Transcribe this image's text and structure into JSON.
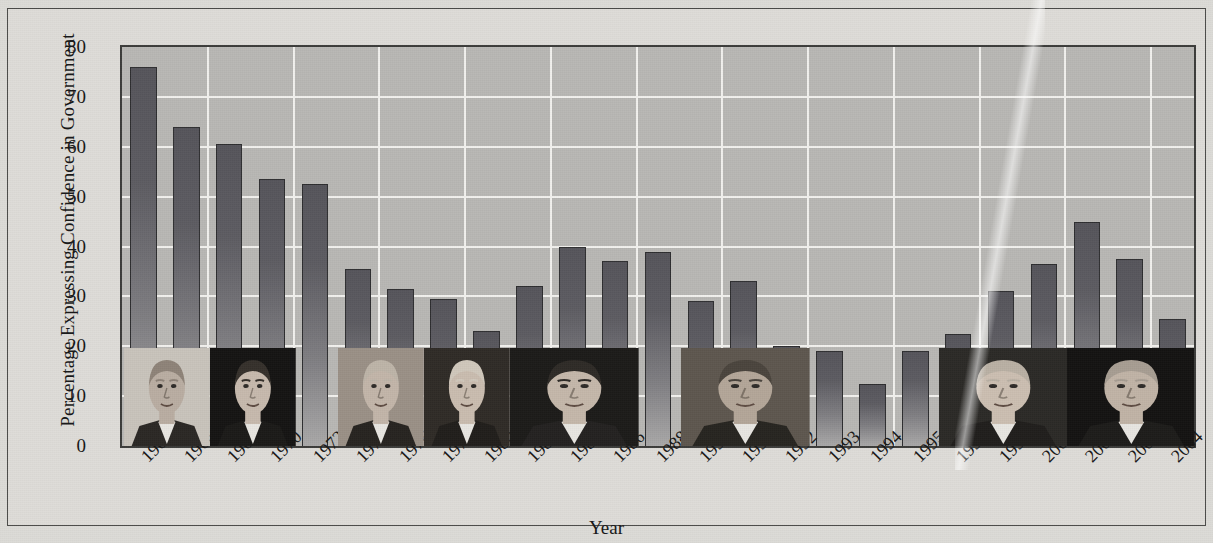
{
  "chart_data": {
    "type": "bar",
    "title": "",
    "xlabel": "Year",
    "ylabel": "Percentage Expressing Confidence in Government",
    "ylim": [
      0,
      80
    ],
    "yticks": [
      0,
      10,
      20,
      30,
      40,
      50,
      60,
      70,
      80
    ],
    "grid": true,
    "legend": "none",
    "categories": [
      "1964",
      "1966",
      "1968",
      "1970",
      "1972",
      "1974",
      "1976",
      "1978",
      "1980",
      "1982",
      "1984",
      "1986",
      "1988",
      "1990",
      "1991",
      "1992",
      "1993",
      "1994",
      "1995",
      "1996",
      "1998",
      "2000",
      "2001",
      "2002",
      "2004"
    ],
    "values": [
      76,
      64,
      60.5,
      53.5,
      52.5,
      35.5,
      31.5,
      29.5,
      23,
      32,
      40,
      37,
      39,
      29,
      33,
      20,
      19,
      12.5,
      19,
      22.5,
      31,
      36.5,
      45,
      37.5,
      25.5
    ],
    "bar_color": "#5a595f",
    "plot_background": "#b8b7b4",
    "gridline_color": "#f2f1ee"
  },
  "axes": {
    "y_title": "Percentage Expressing Confidence in Government",
    "x_title": "Year",
    "y_tick_labels": [
      "0",
      "10",
      "20",
      "30",
      "40",
      "50",
      "60",
      "70",
      "80"
    ],
    "x_tick_labels": [
      "1964",
      "1966",
      "1968",
      "1970",
      "1972",
      "1974",
      "1976",
      "1978",
      "1980",
      "1982",
      "1984",
      "1986",
      "1988",
      "1990",
      "1991",
      "1992",
      "1993",
      "1994",
      "1995",
      "1996",
      "1998",
      "2000",
      "2001",
      "2002",
      "2004"
    ]
  },
  "portraits": [
    {
      "name": "lyndon-b-johnson",
      "start_category": "1964",
      "span": 2,
      "skin": "#b9ada2",
      "hair": "#8e8378",
      "bg": "#c8c3bb",
      "suit": "#2a2724"
    },
    {
      "name": "richard-nixon",
      "start_category": "1968",
      "span": 2,
      "skin": "#c6b9ad",
      "hair": "#35302b",
      "bg": "#141312",
      "suit": "#1a1917"
    },
    {
      "name": "gerald-ford",
      "start_category": "1974",
      "span": 2,
      "skin": "#c2b5a9",
      "hair": "#bdb4a8",
      "bg": "#9a9086",
      "suit": "#26231f"
    },
    {
      "name": "jimmy-carter",
      "start_category": "1978",
      "span": 2,
      "skin": "#c9bcaf",
      "hair": "#cfc7bb",
      "bg": "#2f2b26",
      "suit": "#201d1a"
    },
    {
      "name": "ronald-reagan",
      "start_category": "1982",
      "span": 3,
      "skin": "#c4b7aa",
      "hair": "#2e2a26",
      "bg": "#1b1a18",
      "suit": "#232120"
    },
    {
      "name": "george-h-w-bush",
      "start_category": "1990",
      "span": 3,
      "skin": "#b3a698",
      "hair": "#4a443d",
      "bg": "#5d564e",
      "suit": "#26241f"
    },
    {
      "name": "bill-clinton",
      "start_category": "1996",
      "span": 3,
      "skin": "#cbbeb1",
      "hair": "#b9b0a4",
      "bg": "#2b2926",
      "suit": "#1f1d1b"
    },
    {
      "name": "george-w-bush",
      "start_category": "2001",
      "span": 3,
      "skin": "#c0b3a6",
      "hair": "#a79d92",
      "bg": "#131211",
      "suit": "#1c1b19"
    }
  ]
}
